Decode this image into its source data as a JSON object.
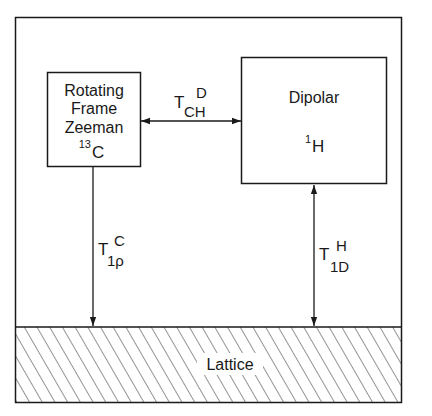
{
  "diagram": {
    "type": "energy-reservoir relaxation diagram",
    "nodes": {
      "zeeman": {
        "lines": [
          "Rotating",
          "Frame",
          "Zeeman"
        ],
        "nucleus_mass": "13",
        "nucleus_symbol": "C"
      },
      "dipolar": {
        "title": "Dipolar",
        "nucleus_mass": "1",
        "nucleus_symbol": "H"
      },
      "lattice": {
        "label": "Lattice",
        "fill_pattern": "diagonal-hatch"
      }
    },
    "edges": [
      {
        "id": "cross-relaxation",
        "from": "zeeman",
        "to": "dipolar",
        "direction": "bidirectional",
        "symbol": "T",
        "superscript": "D",
        "subscript": "CH"
      },
      {
        "id": "carbon-lattice",
        "from": "zeeman",
        "to": "lattice",
        "direction": "one-way",
        "symbol": "T",
        "superscript": "C",
        "subscript": "1ρ"
      },
      {
        "id": "proton-lattice",
        "from": "dipolar",
        "to": "lattice",
        "direction": "bidirectional",
        "symbol": "T",
        "superscript": "H",
        "subscript": "1D"
      }
    ],
    "colors": {
      "line": "#1a1a1a",
      "background": "#ffffff"
    }
  }
}
